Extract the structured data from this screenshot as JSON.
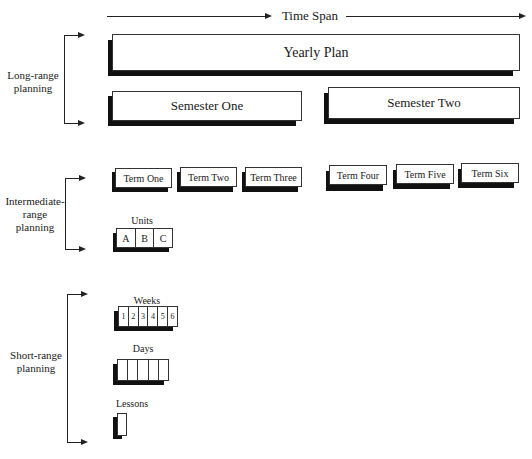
{
  "time_axis": {
    "label": "Time Span"
  },
  "brackets": [
    {
      "label": "Long-range planning"
    },
    {
      "label": "Intermediate-range planning"
    },
    {
      "label": "Short-range planning"
    }
  ],
  "long_range": {
    "yearly": "Yearly Plan",
    "semesters": [
      "Semester One",
      "Semester Two"
    ]
  },
  "intermediate_range": {
    "terms": [
      "Term One",
      "Term Two",
      "Term Three",
      "Term Four",
      "Term Five",
      "Term Six"
    ],
    "units": {
      "label": "Units",
      "cells": [
        "A",
        "B",
        "C"
      ]
    }
  },
  "short_range": {
    "weeks": {
      "label": "Weeks",
      "cells": [
        "1",
        "2",
        "3",
        "4",
        "5",
        "6"
      ]
    },
    "days": {
      "label": "Days",
      "cells": [
        "",
        "",
        "",
        "",
        ""
      ]
    },
    "lessons": {
      "label": "Lessons"
    }
  }
}
